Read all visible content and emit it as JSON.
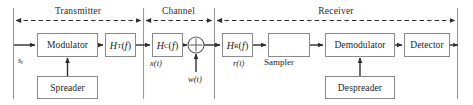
{
  "figure": {
    "type": "block-diagram",
    "sections": [
      {
        "id": "transmitter",
        "label": "Transmitter",
        "span_x": [
          13,
          143
        ]
      },
      {
        "id": "channel",
        "label": "Channel",
        "span_x": [
          143,
          214
        ]
      },
      {
        "id": "receiver",
        "label": "Receiver",
        "span_x": [
          214,
          458
        ]
      }
    ],
    "blocks": [
      {
        "id": "modulator",
        "label": "Modulator",
        "x": 37,
        "y": 33,
        "w": 61,
        "h": 24
      },
      {
        "id": "ht",
        "label": "HT(f)",
        "html": "<span class=\"it\">H</span><span class=\"sub\">T</span>(<span class=\"it\">f</span>)",
        "x": 105,
        "y": 33,
        "w": 31,
        "h": 24
      },
      {
        "id": "hc",
        "label": "HC(f)",
        "html": "<span class=\"it\">H</span><span class=\"sub\">C</span>(<span class=\"it\">f</span>)",
        "x": 152,
        "y": 33,
        "w": 31,
        "h": 24
      },
      {
        "id": "hr",
        "label": "HR(f)",
        "html": "<span class=\"it\">H</span><span class=\"sub\">R</span>(<span class=\"it\">f</span>)",
        "x": 222,
        "y": 33,
        "w": 31,
        "h": 24
      },
      {
        "id": "sampler",
        "label": "",
        "x": 268,
        "y": 33,
        "w": 42,
        "h": 24
      },
      {
        "id": "demodulator",
        "label": "Demodulator",
        "x": 325,
        "y": 33,
        "w": 70,
        "h": 24
      },
      {
        "id": "detector",
        "label": "Detector",
        "x": 404,
        "y": 33,
        "w": 46,
        "h": 24
      },
      {
        "id": "spreader",
        "label": "Spreader",
        "x": 37,
        "y": 76,
        "w": 61,
        "h": 23
      },
      {
        "id": "despreader",
        "label": "Despreader",
        "x": 325,
        "y": 76,
        "w": 70,
        "h": 23
      }
    ],
    "adder": {
      "id": "summing-junction",
      "cx": 196,
      "cy": 45,
      "r": 8,
      "symbol": "plus"
    },
    "signal_labels": [
      {
        "id": "s-t",
        "text": "st",
        "html": "<span class=\"it\">s</span><span class=\"sub-it\">t</span>",
        "x": 18,
        "y": 56
      },
      {
        "id": "x-t",
        "text": "x(t)",
        "html": "<span class=\"it\">x</span>(<span class=\"it\">t</span>)",
        "x": 150,
        "y": 58
      },
      {
        "id": "w-t",
        "text": "w(t)",
        "html": "<span class=\"it\">w</span>(<span class=\"it\">t</span>)",
        "x": 188,
        "y": 76
      },
      {
        "id": "r-t",
        "text": "r(t)",
        "html": "<span class=\"it\">r</span>(<span class=\"it\">t</span>)",
        "x": 232,
        "y": 58
      }
    ],
    "plain_labels": [
      {
        "id": "sampler-caption",
        "text": "Sampler",
        "x": 263,
        "y": 58
      }
    ],
    "colors": {
      "stroke": "#4a4a4a",
      "block_border": "#8a8a8a",
      "divider": "#9a9a9a",
      "text": "#1d1d1d",
      "section_text": "#2b2b2b",
      "background": "#ffffff"
    }
  }
}
